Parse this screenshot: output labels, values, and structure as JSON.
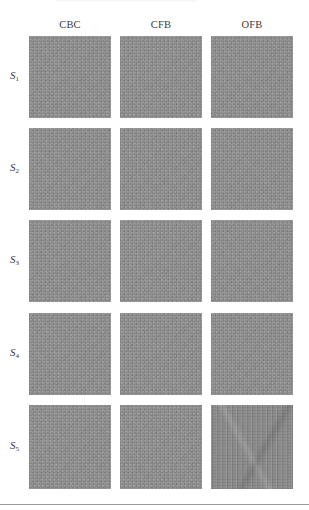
{
  "figure": {
    "columns": [
      "CBC",
      "CFB",
      "OFB"
    ],
    "rows": [
      {
        "base": "S",
        "sub": "1"
      },
      {
        "base": "S",
        "sub": "2"
      },
      {
        "base": "S",
        "sub": "3"
      },
      {
        "base": "S",
        "sub": "4"
      },
      {
        "base": "S",
        "sub": "5"
      }
    ],
    "tile_color": "#8f8f8f",
    "note_structured_tile": "S5 / OFB shows visible structure (vertical streaks)"
  }
}
